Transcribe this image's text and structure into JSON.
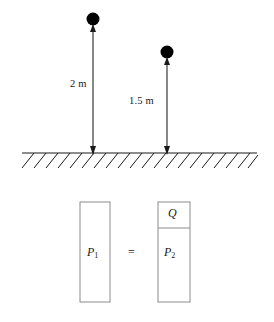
{
  "figure": {
    "background_color": "#ffffff",
    "stroke_color": "#1a1a1a",
    "ball_fill_color": "#000000",
    "box_stroke_color": "#8c8c8c"
  },
  "scene": {
    "ground": {
      "label": "ground-hatched-line",
      "line_y": 153,
      "line_x_start": 22,
      "line_x_end": 257,
      "hatch_count": 20
    },
    "measurements": [
      {
        "id": "left",
        "value_label": "2 m",
        "value": 2,
        "unit": "m",
        "arrow_x": 93,
        "arrow_top_y": 27,
        "arrow_bottom_y": 153,
        "ball_cx": 93,
        "ball_cy": 19,
        "ball_r": 6.5
      },
      {
        "id": "right",
        "value_label": "1.5 m",
        "value": 1.5,
        "unit": "m",
        "arrow_x": 167,
        "arrow_top_y": 60,
        "arrow_bottom_y": 153,
        "ball_cx": 167,
        "ball_cy": 52,
        "ball_r": 6.5
      }
    ]
  },
  "equation": {
    "left_box": {
      "label_text": "P",
      "label_sub": "1",
      "x": 80,
      "y": 202,
      "width": 30,
      "height": 100
    },
    "operator": "=",
    "right_box": {
      "top_cell_label": "Q",
      "bottom_cell_label_text": "P",
      "bottom_cell_label_sub": "2",
      "x": 158,
      "y": 202,
      "width": 32,
      "height": 100,
      "divider_y": 228
    }
  }
}
